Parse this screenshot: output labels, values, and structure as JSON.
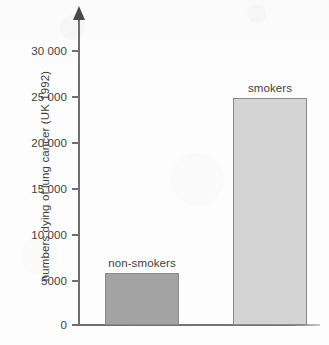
{
  "chart_data": {
    "type": "bar",
    "title": "",
    "subtitle": "",
    "xlabel": "",
    "ylabel": "numbers dying of lung cancer (UK 1992)",
    "categories": [
      "non-smokers",
      "smokers"
    ],
    "values": [
      5700,
      24800
    ],
    "ylim": [
      0,
      32000
    ],
    "yticks": [
      0,
      5000,
      10000,
      15000,
      20000,
      25000,
      30000
    ],
    "ytick_labels": [
      "0",
      "5000",
      "10 000",
      "15 000",
      "20 000",
      "25 000",
      "30 000"
    ],
    "grid": false,
    "legend": false,
    "legend_position": "none",
    "annotations": [
      "non-smokers",
      "smokers"
    ],
    "bar_colors": [
      "#a3a3a3",
      "#d4d4d4"
    ],
    "bar_edge_color": "#8a8a8a",
    "axis_color": "#6f6f6f",
    "text_color": "#3f3f3f",
    "background_color": "#fdfdfd",
    "y_axis_has_arrow": true
  },
  "axis": {
    "ticks": [
      {
        "label": "30 000",
        "value": 30000
      },
      {
        "label": "25 000",
        "value": 25000
      },
      {
        "label": "20 000",
        "value": 20000
      },
      {
        "label": "15 000",
        "value": 15000
      },
      {
        "label": "10 000",
        "value": 10000
      },
      {
        "label": "5000",
        "value": 5000
      },
      {
        "label": "0",
        "value": 0
      }
    ]
  },
  "bars": [
    {
      "label": "non-smokers",
      "value": 5700
    },
    {
      "label": "smokers",
      "value": 24800
    }
  ]
}
